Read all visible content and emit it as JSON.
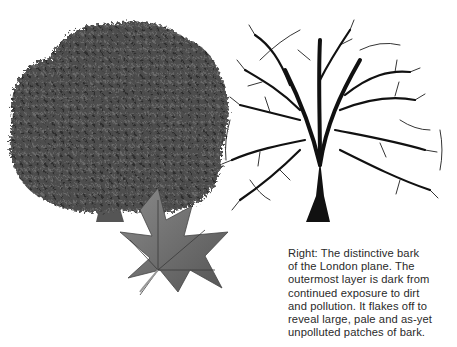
{
  "illustration": {
    "left_tree": {
      "label": "London plane tree in leaf",
      "tone": "#4a4a4a"
    },
    "right_tree": {
      "label": "London plane tree in winter silhouette",
      "tone": "#111111"
    },
    "leaf": {
      "label": "London plane leaf",
      "tone": "#6e6e6e"
    }
  },
  "caption": {
    "lines": [
      "Right: The distinctive bark",
      "of the London plane. The",
      "outermost layer is dark from",
      "continued exposure to dirt",
      "and pollution. It flakes off to",
      "reveal large, pale and as-yet",
      "unpolluted patches of bark."
    ]
  }
}
